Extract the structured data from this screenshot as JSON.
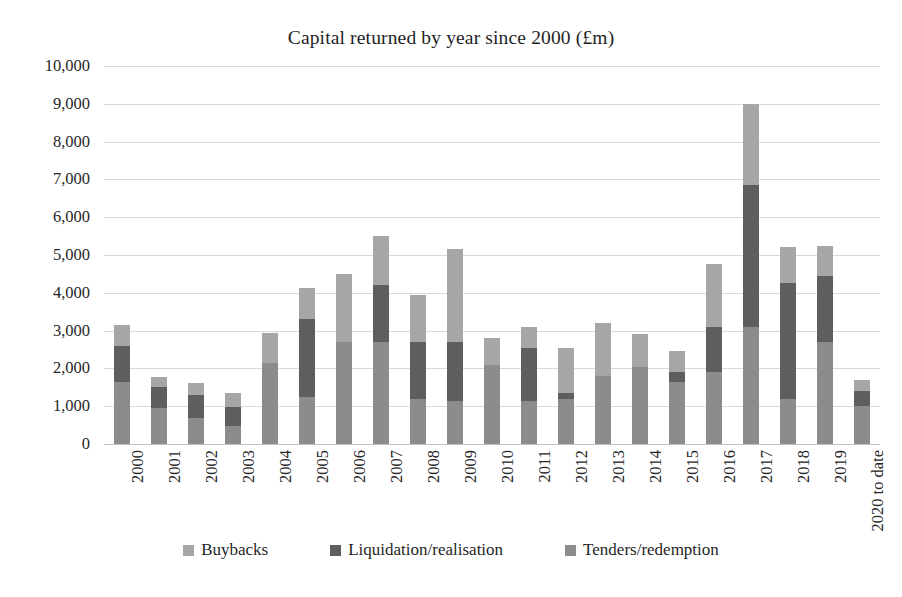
{
  "chart_data": {
    "type": "bar",
    "subtype": "stacked-column",
    "title": "Capital returned by year since 2000 (£m)",
    "xlabel": "",
    "ylabel": "",
    "ylim": [
      0,
      10000
    ],
    "ytick_step": 1000,
    "grid": true,
    "legend_position": "bottom",
    "categories": [
      "2000",
      "2001",
      "2002",
      "2003",
      "2004",
      "2005",
      "2006",
      "2007",
      "2008",
      "2009",
      "2010",
      "2011",
      "2012",
      "2013",
      "2014",
      "2015",
      "2016",
      "2017",
      "2018",
      "2019",
      "2020 to date"
    ],
    "ytick_labels": [
      "10,000",
      "9,000",
      "8,000",
      "7,000",
      "6,000",
      "5,000",
      "4,000",
      "3,000",
      "2,000",
      "1,000",
      "0"
    ],
    "ytick_values": [
      10000,
      9000,
      8000,
      7000,
      6000,
      5000,
      4000,
      3000,
      2000,
      1000,
      0
    ],
    "series": [
      {
        "name": "Tenders/redemption",
        "color": "#8c8c8c",
        "stack_order": 0,
        "values": [
          1650,
          950,
          700,
          480,
          2150,
          1250,
          2700,
          2700,
          1200,
          1150,
          2100,
          1150,
          1200,
          1800,
          2050,
          1650,
          1900,
          3100,
          1200,
          2700,
          1000
        ]
      },
      {
        "name": "Liquidation/realisation",
        "color": "#5e5e5e",
        "stack_order": 1,
        "values": [
          950,
          550,
          600,
          500,
          0,
          2050,
          0,
          1500,
          1500,
          1550,
          0,
          1400,
          150,
          0,
          0,
          250,
          1200,
          3750,
          3050,
          1750,
          400
        ]
      },
      {
        "name": "Buybacks",
        "color": "#a6a6a6",
        "stack_order": 2,
        "values": [
          550,
          280,
          320,
          380,
          800,
          830,
          1800,
          1300,
          1250,
          2450,
          700,
          550,
          1200,
          1400,
          850,
          550,
          1650,
          2150,
          950,
          800,
          300
        ]
      }
    ],
    "totals": [
      3150,
      1780,
      1620,
      1360,
      2950,
      4130,
      4500,
      5500,
      3950,
      5150,
      2800,
      3100,
      2550,
      3200,
      2900,
      2450,
      4750,
      9000,
      5200,
      5250,
      1700
    ]
  },
  "legend": {
    "items": [
      {
        "label": "Buybacks",
        "color": "#a6a6a6"
      },
      {
        "label": "Liquidation/realisation",
        "color": "#5e5e5e"
      },
      {
        "label": "Tenders/redemption",
        "color": "#8c8c8c"
      }
    ]
  },
  "colors": {
    "buybacks": "#a6a6a6",
    "liquidation": "#5e5e5e",
    "tenders": "#8c8c8c",
    "gridline": "#d9d9d9",
    "text": "#262626",
    "background": "#ffffff"
  }
}
